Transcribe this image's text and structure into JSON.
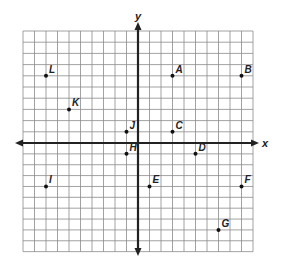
{
  "diagram": {
    "type": "coordinate-plane",
    "axes": {
      "x_label": "x",
      "y_label": "y"
    },
    "grid": {
      "x_min": -10,
      "x_max": 10,
      "y_min": -10,
      "y_max": 10
    },
    "colors": {
      "grid": "#8a8a8a",
      "axis": "#222222",
      "point": "#111111"
    },
    "points": [
      {
        "label": "A",
        "x": 3,
        "y": 6
      },
      {
        "label": "B",
        "x": 9,
        "y": 6
      },
      {
        "label": "C",
        "x": 3,
        "y": 1
      },
      {
        "label": "D",
        "x": 5,
        "y": -1
      },
      {
        "label": "E",
        "x": 1,
        "y": -4
      },
      {
        "label": "F",
        "x": 9,
        "y": -4
      },
      {
        "label": "G",
        "x": 7,
        "y": -8
      },
      {
        "label": "H",
        "x": -1,
        "y": -1
      },
      {
        "label": "I",
        "x": -8,
        "y": -4
      },
      {
        "label": "J",
        "x": -1,
        "y": 1
      },
      {
        "label": "K",
        "x": -6,
        "y": 3
      },
      {
        "label": "L",
        "x": -8,
        "y": 6
      }
    ]
  }
}
